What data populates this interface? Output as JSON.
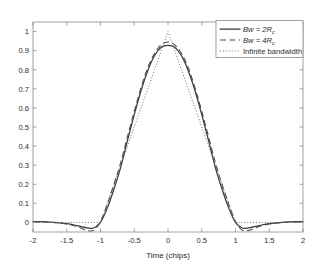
{
  "chart_data": {
    "type": "line",
    "title": "",
    "xlabel": "Time (chips)",
    "ylabel": "",
    "xlim": [
      -2,
      2
    ],
    "ylim": [
      -0.05,
      1.05
    ],
    "grid": false,
    "legend_position": "top-right",
    "xticks": [
      "-2",
      "-1.5",
      "-1",
      "-0.5",
      "0",
      "0.5",
      "1",
      "1.5",
      "2"
    ],
    "xtick_values": [
      -2,
      -1.5,
      -1,
      -0.5,
      0,
      0.5,
      1,
      1.5,
      2
    ],
    "yticks": [
      "0",
      "0.1",
      "0.2",
      "0.3",
      "0.4",
      "0.5",
      "0.6",
      "0.7",
      "0.8",
      "0.9",
      "1"
    ],
    "ytick_values": [
      0,
      0.1,
      0.2,
      0.3,
      0.4,
      0.5,
      0.6,
      0.7,
      0.8,
      0.9,
      1
    ],
    "x": [
      -2,
      -1.9,
      -1.8,
      -1.7,
      -1.6,
      -1.5,
      -1.4,
      -1.3,
      -1.2,
      -1.1,
      -1,
      -0.9,
      -0.8,
      -0.7,
      -0.6,
      -0.5,
      -0.4,
      -0.3,
      -0.2,
      -0.1,
      0,
      0.1,
      0.2,
      0.3,
      0.4,
      0.5,
      0.6,
      0.7,
      0.8,
      0.9,
      1,
      1.1,
      1.2,
      1.3,
      1.4,
      1.5,
      1.6,
      1.7,
      1.8,
      1.9,
      2
    ],
    "series": [
      {
        "name": "Bw = 2Rc",
        "label_main": "Bw = 2R",
        "label_sub": "c",
        "style": "solid",
        "color": "#3b3b3b",
        "values": [
          0.004,
          0.004,
          0.003,
          0.001,
          -0.002,
          -0.006,
          -0.012,
          -0.02,
          -0.028,
          -0.029,
          0.0,
          0.075,
          0.175,
          0.29,
          0.43,
          0.565,
          0.69,
          0.795,
          0.873,
          0.918,
          0.928,
          0.918,
          0.873,
          0.795,
          0.69,
          0.565,
          0.43,
          0.29,
          0.175,
          0.075,
          0.0,
          -0.029,
          -0.028,
          -0.02,
          -0.012,
          -0.006,
          -0.002,
          0.001,
          0.003,
          0.004,
          0.004
        ]
      },
      {
        "name": "Bw = 4Rc",
        "label_main": "Bw = 4R",
        "label_sub": "c",
        "style": "dashed",
        "color": "#4a4a4a",
        "values": [
          0.002,
          0.003,
          0.002,
          0.0,
          -0.003,
          -0.008,
          -0.016,
          -0.028,
          -0.042,
          -0.04,
          0.005,
          0.095,
          0.2,
          0.315,
          0.45,
          0.582,
          0.705,
          0.81,
          0.885,
          0.93,
          0.945,
          0.93,
          0.885,
          0.81,
          0.705,
          0.582,
          0.45,
          0.315,
          0.2,
          0.095,
          0.005,
          -0.04,
          -0.042,
          -0.028,
          -0.016,
          -0.008,
          -0.003,
          0.0,
          0.002,
          0.003,
          0.002
        ]
      },
      {
        "name": "Infinite bandwidth",
        "label_main": "Infinite bandwidth",
        "label_sub": "",
        "style": "dotted",
        "color": "#6f6f6f",
        "values": [
          0,
          0,
          0,
          0,
          0,
          0,
          0,
          0,
          0,
          0,
          0,
          0.1,
          0.2,
          0.3,
          0.4,
          0.5,
          0.6,
          0.7,
          0.8,
          0.9,
          1.0,
          0.9,
          0.8,
          0.7,
          0.6,
          0.5,
          0.4,
          0.3,
          0.2,
          0.1,
          0,
          0,
          0,
          0,
          0,
          0,
          0,
          0,
          0,
          0,
          0
        ]
      }
    ]
  }
}
